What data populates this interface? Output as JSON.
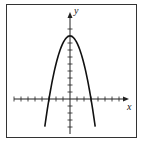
{
  "chart_data": {
    "type": "line",
    "title": "",
    "xlabel": "x",
    "ylabel": "y",
    "function": "y = 9 - x^2",
    "x": [
      -3.6,
      -3,
      -2,
      -1,
      0,
      1,
      2,
      3,
      3.6
    ],
    "series": [
      {
        "name": "parabola",
        "values": [
          -3.96,
          0,
          5,
          8,
          9,
          8,
          5,
          0,
          -3.96
        ]
      }
    ],
    "xlim": [
      -8,
      8
    ],
    "ylim": [
      -5,
      10
    ],
    "x_ticks": [
      -8,
      -7,
      -6,
      -5,
      -4,
      -3,
      -2,
      -1,
      1,
      2,
      3,
      4,
      5,
      6,
      7,
      8
    ],
    "y_ticks": [
      -5,
      -4,
      -3,
      -2,
      -1,
      1,
      2,
      3,
      4,
      5,
      6,
      7,
      8,
      9,
      10
    ],
    "grid": false,
    "legend": null
  },
  "labels": {
    "x_axis": "x",
    "y_axis": "y"
  }
}
